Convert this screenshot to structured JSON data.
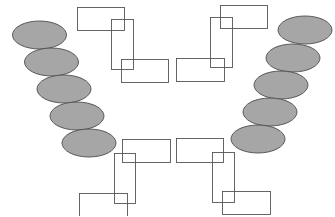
{
  "diagram": {
    "width": 335,
    "height": 216,
    "background": "#ffffff",
    "ellipse_style": {
      "fill": "#a6a6a6",
      "stroke": "#4d4d4d",
      "stroke_width": 0.9
    },
    "rect_style": {
      "fill": "none",
      "stroke": "#555555",
      "stroke_width": 0.9
    },
    "ellipse_chains": [
      {
        "name": "left-ellipse-chain",
        "ellipses": [
          {
            "cx": 39.5,
            "cy": 35,
            "rx": 27,
            "ry": 14
          },
          {
            "cx": 51.5,
            "cy": 62,
            "rx": 27,
            "ry": 14
          },
          {
            "cx": 64,
            "cy": 89,
            "rx": 27,
            "ry": 14
          },
          {
            "cx": 77,
            "cy": 116,
            "rx": 27,
            "ry": 14
          },
          {
            "cx": 89,
            "cy": 143,
            "rx": 27,
            "ry": 14
          }
        ]
      },
      {
        "name": "right-ellipse-chain",
        "ellipses": [
          {
            "cx": 305,
            "cy": 30,
            "rx": 27,
            "ry": 14
          },
          {
            "cx": 293,
            "cy": 58,
            "rx": 27,
            "ry": 14
          },
          {
            "cx": 281,
            "cy": 85,
            "rx": 27,
            "ry": 14
          },
          {
            "cx": 270,
            "cy": 112,
            "rx": 27,
            "ry": 14
          },
          {
            "cx": 258,
            "cy": 139,
            "rx": 27,
            "ry": 14
          }
        ]
      }
    ],
    "rect_groups": [
      {
        "name": "top-left-rect-group",
        "rects": [
          {
            "x": 77,
            "y": 7,
            "w": 47,
            "h": 23
          },
          {
            "x": 111,
            "y": 19,
            "w": 22,
            "h": 50
          },
          {
            "x": 121,
            "y": 59,
            "w": 47,
            "h": 23
          }
        ]
      },
      {
        "name": "top-right-rect-group",
        "rects": [
          {
            "x": 220,
            "y": 5,
            "w": 47,
            "h": 23
          },
          {
            "x": 210,
            "y": 17,
            "w": 22,
            "h": 50
          },
          {
            "x": 176,
            "y": 58,
            "w": 48,
            "h": 23
          }
        ]
      },
      {
        "name": "bottom-left-rect-group",
        "rects": [
          {
            "x": 122,
            "y": 139,
            "w": 48,
            "h": 23
          },
          {
            "x": 114,
            "y": 153,
            "w": 21,
            "h": 50
          },
          {
            "x": 79,
            "y": 193,
            "w": 48,
            "h": 23
          }
        ]
      },
      {
        "name": "bottom-right-rect-group",
        "rects": [
          {
            "x": 176,
            "y": 138,
            "w": 47,
            "h": 24
          },
          {
            "x": 212,
            "y": 152,
            "w": 22,
            "h": 50
          },
          {
            "x": 222,
            "y": 191,
            "w": 48,
            "h": 23
          }
        ]
      }
    ]
  }
}
